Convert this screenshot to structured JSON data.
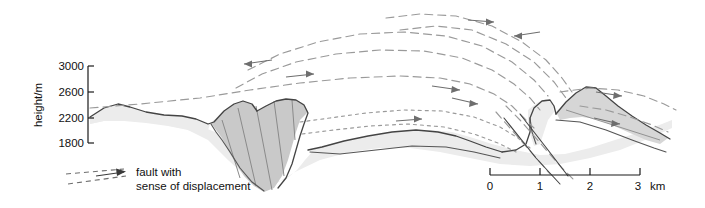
{
  "figure": {
    "kind": "geological-cross-section",
    "background_color": "#ffffff"
  },
  "y_axis": {
    "title": "height/m",
    "ticks": [
      "3000",
      "2600",
      "2200",
      "1800"
    ],
    "tick_values": [
      3000,
      2600,
      2200,
      1800
    ],
    "unit": "m",
    "axis_color": "#1a1a1a"
  },
  "legend": {
    "line1": "fault with",
    "line2": "sense of displacement",
    "symbol": "dashed-line-with-arrowhead"
  },
  "scale_bar": {
    "labels": [
      "0",
      "1",
      "2",
      "3"
    ],
    "unit": "km",
    "unit_label": "km",
    "divisions": 3,
    "line_color": "#1a1a1a"
  },
  "units": {
    "basement_fill": "#ececec",
    "nappe_fill": "#c9c9c9",
    "slab_fill": "#d6d6d6",
    "outline_color": "#555555",
    "fault_color": "#9a9a9a",
    "bedding_color": "#8a8a8a"
  }
}
